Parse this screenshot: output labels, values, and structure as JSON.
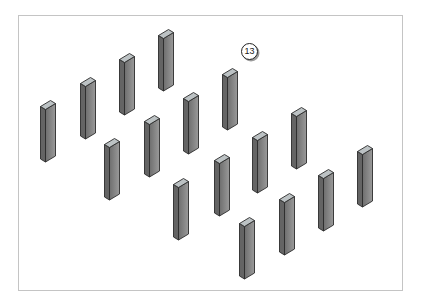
{
  "figure": {
    "type": "isometric-pillar-array-diagram",
    "pillar_count": 16,
    "callout": {
      "label": "13"
    }
  },
  "colors": {
    "background": "#ffffff",
    "frame_border": "#c4c4c4",
    "outline": "#2b2b2b",
    "pillar_left_face": "#646464",
    "pillar_front_face_dark": "#6e6e6e",
    "pillar_front_face_light": "#9a9a9a",
    "pillar_top_face": "#bcc2c4",
    "callout_shadow": "#9a9a9a"
  },
  "pillars": {
    "symbol_width": 16,
    "symbol_height": 63,
    "positions": [
      {
        "x": 158,
        "y": 29
      },
      {
        "x": 119,
        "y": 53
      },
      {
        "x": 80,
        "y": 77
      },
      {
        "x": 40,
        "y": 100
      },
      {
        "x": 222,
        "y": 68
      },
      {
        "x": 183,
        "y": 92
      },
      {
        "x": 144,
        "y": 115
      },
      {
        "x": 104,
        "y": 138
      },
      {
        "x": 291,
        "y": 107
      },
      {
        "x": 252,
        "y": 131
      },
      {
        "x": 214,
        "y": 154
      },
      {
        "x": 173,
        "y": 178
      },
      {
        "x": 357,
        "y": 145
      },
      {
        "x": 318,
        "y": 169
      },
      {
        "x": 279,
        "y": 193
      },
      {
        "x": 239,
        "y": 217
      }
    ]
  },
  "frame": {
    "left": 18,
    "top": 15,
    "width": 385,
    "height": 276
  }
}
